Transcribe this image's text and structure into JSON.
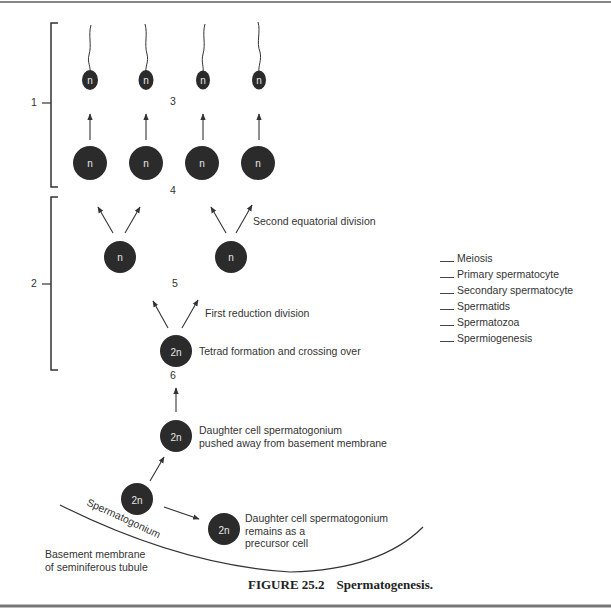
{
  "figure": {
    "caption_label": "FIGURE 25.2",
    "caption_title": "Spermatogenesis."
  },
  "brackets": {
    "one": "1",
    "two": "2"
  },
  "numbers": {
    "three": "3",
    "four": "4",
    "five": "5",
    "six": "6"
  },
  "cells": {
    "haploid": "n",
    "diploid": "2n"
  },
  "annotations": {
    "second_division": "Second equatorial division",
    "first_division": "First reduction division",
    "tetrad": "Tetrad formation and crossing over",
    "pushed_line1": "Daughter cell spermatogonium",
    "pushed_line2": "pushed away from basement membrane",
    "remains_line1": "Daughter cell spermatogonium",
    "remains_line2": "remains as a",
    "remains_line3": "precursor cell",
    "spermatogonium": "Spermatogonium",
    "membrane_line1": "Basement membrane",
    "membrane_line2": "of seminiferous tubule"
  },
  "legend": {
    "items": [
      {
        "label": "Meiosis"
      },
      {
        "label": "Primary spermatocyte"
      },
      {
        "label": "Secondary spermatocyte"
      },
      {
        "label": "Spermatids"
      },
      {
        "label": "Spermatozoa"
      },
      {
        "label": "Spermiogenesis"
      }
    ]
  },
  "colors": {
    "cell_fill": "#2b2b2b",
    "line": "#333333"
  }
}
